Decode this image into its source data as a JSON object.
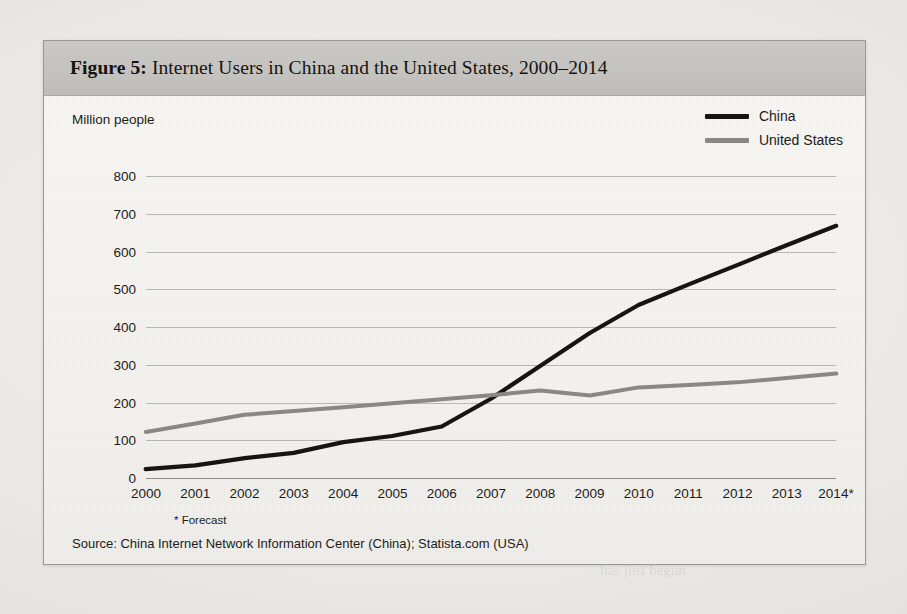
{
  "figure": {
    "number_label": "Figure 5:",
    "title_text": "Internet Users in China and the United States, 2000–2014",
    "footnote": "* Forecast",
    "source": "Source: China Internet Network Information Center (China); Statista.com (USA)"
  },
  "colors": {
    "china": "#17150f",
    "united_states": "#8a8985",
    "gridline": "#b9b8b4",
    "axis": "#8f8e8a",
    "header_band": "#c4c3bf",
    "page": "#e9e8e4",
    "figure_bg": "#f4f3f0",
    "text": "#1d1c1a"
  },
  "chart_data": {
    "type": "line",
    "title": "Internet Users in China and the United States, 2000–2014",
    "xlabel": "",
    "ylabel": "Million people",
    "ylim": [
      0,
      800
    ],
    "ytick_step": 100,
    "yticks": [
      "800",
      "700",
      "600",
      "500",
      "400",
      "300",
      "200",
      "100",
      "0"
    ],
    "grid": true,
    "legend_position": "top-right",
    "categories": [
      "2000",
      "2001",
      "2002",
      "2003",
      "2004",
      "2005",
      "2006",
      "2007",
      "2008",
      "2009",
      "2010",
      "2011",
      "2012",
      "2013",
      "2014*"
    ],
    "series": [
      {
        "name": "China",
        "color": "#17150f",
        "values": [
          22,
          34,
          52,
          68,
          95,
          110,
          137,
          210,
          298,
          384,
          457,
          513,
          564,
          618,
          668
        ]
      },
      {
        "name": "United States",
        "color": "#8a8985",
        "values": [
          122,
          143,
          168,
          177,
          189,
          198,
          207,
          220,
          231,
          220,
          240,
          245,
          254,
          264,
          278
        ]
      }
    ],
    "annotations": [
      "* Forecast"
    ]
  },
  "bleed_through": [
    {
      "text": "available for commercial use",
      "x": 215,
      "y": 148,
      "size": 15
    },
    {
      "text": "for reference only in the text",
      "x": 215,
      "y": 176,
      "size": 15
    },
    {
      "text": "also, the percentage of population growth",
      "x": 215,
      "y": 204,
      "size": 15
    },
    {
      "text": "by several factors. See the table.",
      "x": 215,
      "y": 232,
      "size": 15
    },
    {
      "text": "FUTURE CHINA",
      "x": 600,
      "y": 392,
      "size": 19
    },
    {
      "text": "has just begun",
      "x": 600,
      "y": 562,
      "size": 15
    }
  ]
}
